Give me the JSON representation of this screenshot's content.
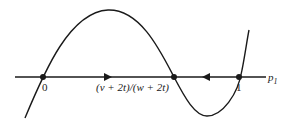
{
  "diagram": {
    "axis_label": "p",
    "axis_label_sub": "1",
    "points": [
      {
        "label": "0",
        "x": 43
      },
      {
        "label": "(v + 2t)/(w + 2t)",
        "x": 174
      },
      {
        "label": "1",
        "x": 239
      }
    ],
    "arrows": [
      {
        "direction": "right",
        "x": 110
      },
      {
        "direction": "left",
        "x": 206
      }
    ],
    "colors": {
      "stroke": "#1a1a1a"
    }
  }
}
